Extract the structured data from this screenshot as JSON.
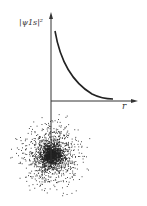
{
  "diagram": {
    "y_axis_label": "|ψ1s|²",
    "x_axis_label": "r",
    "curve": "exponential decay",
    "cloud": "electron density dot cloud centered at nucleus",
    "colors": {
      "ink": "#222222",
      "background": "#ffffff"
    }
  },
  "chart_data": {
    "type": "line",
    "title": "",
    "xlabel": "r",
    "ylabel": "|ψ1s|²",
    "x": [
      0.1,
      0.5,
      1,
      1.5,
      2,
      2.5,
      3
    ],
    "values": [
      0.82,
      0.37,
      0.14,
      0.05,
      0.018,
      0.007,
      0.002
    ],
    "grid": false,
    "legend": null
  }
}
